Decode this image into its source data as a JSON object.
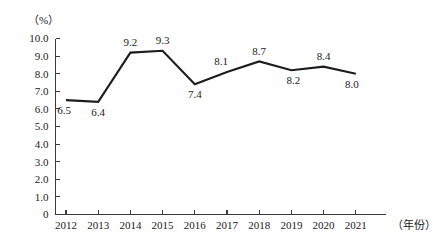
{
  "chart_data": {
    "type": "line",
    "title": "",
    "xlabel": "（年份）",
    "ylabel": "（%）",
    "categories": [
      "2012",
      "2013",
      "2014",
      "2015",
      "2016",
      "2017",
      "2018",
      "2019",
      "2020",
      "2021"
    ],
    "values": [
      6.5,
      6.4,
      9.2,
      9.3,
      7.4,
      8.1,
      8.7,
      8.2,
      8.4,
      8.0
    ],
    "point_labels": [
      "6.5",
      "6.4",
      "9.2",
      "9.3",
      "7.4",
      "8.1",
      "8.7",
      "8.2",
      "8.4",
      "8.0"
    ],
    "label_positions": [
      "below",
      "below",
      "above",
      "above",
      "below",
      "above",
      "above",
      "below",
      "above",
      "below"
    ],
    "ylim": [
      0,
      10
    ],
    "ytick_labels": [
      "10.0",
      "9.0",
      "8.0",
      "7.0",
      "6.0",
      "5.0",
      "4.0",
      "3.0",
      "2.0",
      "1.0",
      "0"
    ],
    "ytick_values": [
      10,
      9,
      8,
      7,
      6,
      5,
      4,
      3,
      2,
      1,
      0
    ],
    "grid": false,
    "legend": null,
    "series_color": "#1d1d1d",
    "axis_color": "#3b3b3b"
  },
  "axes": {
    "y_unit_label": "（%）",
    "x_unit_label": "（年份）"
  }
}
